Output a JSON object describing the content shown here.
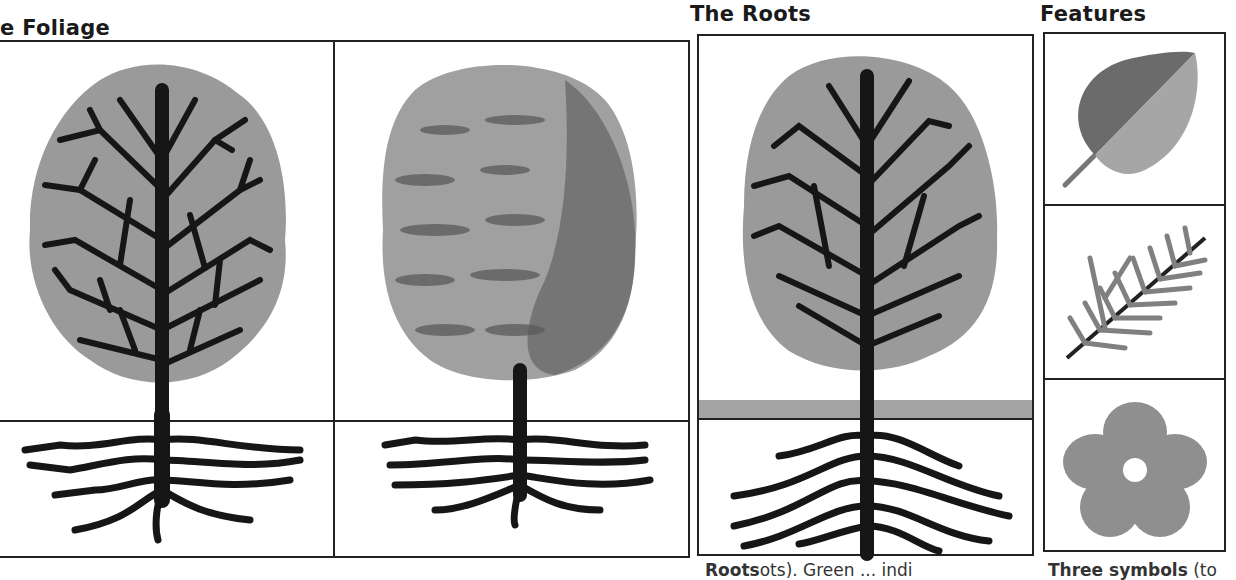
{
  "headings": {
    "foliage": "e Foliage",
    "roots": "The Roots",
    "features": "Features"
  },
  "panels": {
    "foliage_left": {
      "label": "Tree with branch structure (bare branches over grey crown)"
    },
    "foliage_right": {
      "label": "Tree with textured foliage crown"
    },
    "roots": {
      "label": "Tree with ground line showing root spread"
    },
    "features": [
      {
        "label": "leaf",
        "icon": "leaf-icon"
      },
      {
        "label": "conifer sprig",
        "icon": "conifer-sprig-icon"
      },
      {
        "label": "flower",
        "icon": "flower-icon"
      }
    ]
  },
  "captions": {
    "roots_caption_bold": "Roots",
    "roots_caption_rest": "ots). Green ... indi",
    "features_caption_bold": "Three symbols",
    "features_caption_rest": " (to"
  },
  "colors": {
    "crown": "#9a9a9a",
    "crown_dark": "#5e5e5e",
    "trunk": "#161616",
    "ground": "#a3a3a3",
    "leaf_dark": "#6b6b6b",
    "leaf_light": "#a6a6a6",
    "flower": "#8f8f8f",
    "border": "#222222"
  }
}
